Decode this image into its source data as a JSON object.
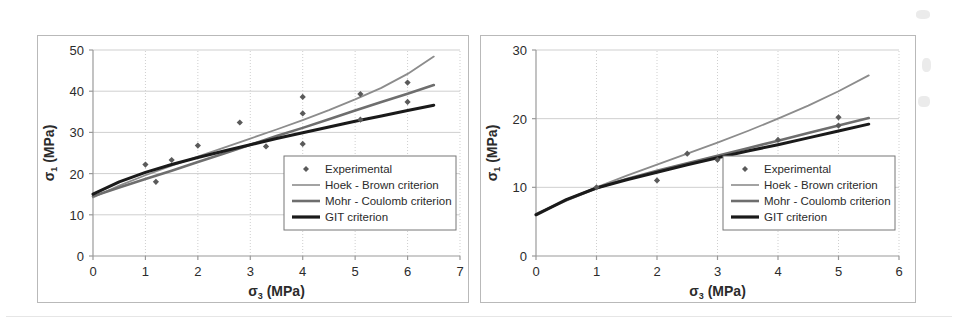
{
  "figure": {
    "background": "#ffffff",
    "panel_border_color": "#b9b9b9"
  },
  "colors": {
    "experimental_marker": "#5a5a5a",
    "hoek_brown": "#8c8c8c",
    "mohr_coulomb": "#6e6e6e",
    "git": "#1a1a1a",
    "gridline": "#cfcfcf",
    "axis": "#9a9a9a",
    "text": "#2b2b2b"
  },
  "legend": {
    "items": [
      {
        "label": "Experimental",
        "style": "marker",
        "color": "#5a5a5a",
        "width": 0
      },
      {
        "label": "Hoek - Brown criterion",
        "style": "line",
        "color": "#8c8c8c",
        "width": 1.6
      },
      {
        "label": "Mohr - Coulomb criterion",
        "style": "line",
        "color": "#6e6e6e",
        "width": 2.6
      },
      {
        "label": "GIT criterion",
        "style": "line",
        "color": "#1a1a1a",
        "width": 3.2
      }
    ]
  },
  "chart_data": [
    {
      "id": "left",
      "type": "line",
      "title": "",
      "xlabel": "σ₃ (MPa)",
      "ylabel": "σ₁ (MPa)",
      "xlabel_base": "σ",
      "xlabel_sub": "3",
      "xlabel_unit": " (MPa)",
      "ylabel_base": "σ",
      "ylabel_sub": "1",
      "ylabel_unit": " (MPa)",
      "xlim": [
        0,
        7
      ],
      "ylim": [
        0,
        50
      ],
      "xticks": [
        0,
        1,
        2,
        3,
        4,
        5,
        6,
        7
      ],
      "yticks": [
        0,
        10,
        20,
        30,
        40,
        50
      ],
      "grid": true,
      "legend_position": "lower-right",
      "scatter": {
        "name": "Experimental",
        "points": [
          [
            1.0,
            22.2
          ],
          [
            1.2,
            18.0
          ],
          [
            1.5,
            23.3
          ],
          [
            2.0,
            26.8
          ],
          [
            2.8,
            32.4
          ],
          [
            3.3,
            26.6
          ],
          [
            4.0,
            38.6
          ],
          [
            4.0,
            34.6
          ],
          [
            4.0,
            27.2
          ],
          [
            5.1,
            39.3
          ],
          [
            5.1,
            33.1
          ],
          [
            6.0,
            42.1
          ],
          [
            6.0,
            37.4
          ]
        ]
      },
      "series": [
        {
          "name": "Hoek - Brown criterion",
          "color": "#8c8c8c",
          "width": 1.8,
          "x": [
            0.0,
            0.5,
            1.0,
            1.5,
            2.0,
            2.5,
            3.0,
            3.5,
            4.0,
            4.5,
            5.0,
            5.5,
            6.0,
            6.5
          ],
          "y": [
            14.2,
            17.1,
            19.6,
            21.9,
            24.1,
            26.3,
            28.5,
            30.7,
            33.0,
            35.4,
            38.0,
            40.8,
            44.2,
            48.4
          ]
        },
        {
          "name": "Mohr - Coulomb criterion",
          "color": "#6e6e6e",
          "width": 2.6,
          "x": [
            0.0,
            0.5,
            1.0,
            1.5,
            2.0,
            2.5,
            3.0,
            3.5,
            4.0,
            4.5,
            5.0,
            5.5,
            6.0,
            6.5
          ],
          "y": [
            14.5,
            16.6,
            18.7,
            20.7,
            22.8,
            24.9,
            27.0,
            29.1,
            31.1,
            33.2,
            35.3,
            37.4,
            39.4,
            41.5
          ]
        },
        {
          "name": "GIT criterion",
          "color": "#1a1a1a",
          "width": 3.0,
          "x": [
            0.0,
            0.5,
            1.0,
            1.5,
            2.0,
            2.5,
            3.0,
            3.5,
            4.0,
            4.5,
            5.0,
            5.5,
            6.0,
            6.5
          ],
          "y": [
            15.0,
            18.0,
            20.3,
            22.2,
            23.9,
            25.5,
            27.0,
            28.5,
            29.9,
            31.3,
            32.7,
            34.0,
            35.3,
            36.6
          ]
        }
      ]
    },
    {
      "id": "right",
      "type": "line",
      "title": "",
      "xlabel": "σ₃ (MPa)",
      "ylabel": "σ₁ (MPa)",
      "xlabel_base": "σ",
      "xlabel_sub": "3",
      "xlabel_unit": " (MPa)",
      "ylabel_base": "σ",
      "ylabel_sub": "1",
      "ylabel_unit": " (MPa)",
      "xlim": [
        0,
        6
      ],
      "ylim": [
        0,
        30
      ],
      "xticks": [
        0,
        1,
        2,
        3,
        4,
        5,
        6
      ],
      "yticks": [
        0,
        10,
        20,
        30
      ],
      "grid": true,
      "legend_position": "lower-right",
      "scatter": {
        "name": "Experimental",
        "points": [
          [
            1.0,
            10.0
          ],
          [
            2.0,
            11.0
          ],
          [
            2.5,
            14.9
          ],
          [
            3.0,
            14.0
          ],
          [
            4.0,
            16.9
          ],
          [
            5.0,
            20.2
          ],
          [
            5.0,
            19.0
          ]
        ]
      },
      "series": [
        {
          "name": "Hoek - Brown criterion",
          "color": "#8c8c8c",
          "width": 1.8,
          "x": [
            0.0,
            0.5,
            1.0,
            1.5,
            2.0,
            2.5,
            3.0,
            3.5,
            4.0,
            4.5,
            5.0,
            5.5
          ],
          "y": [
            6.0,
            8.2,
            10.0,
            11.7,
            13.3,
            14.9,
            16.5,
            18.2,
            20.0,
            21.9,
            24.0,
            26.3
          ]
        },
        {
          "name": "Mohr - Coulomb criterion",
          "color": "#6e6e6e",
          "width": 2.6,
          "x": [
            0.0,
            0.5,
            1.0,
            1.5,
            2.0,
            2.5,
            3.0,
            3.5,
            4.0,
            4.5,
            5.0,
            5.5
          ],
          "y": [
            6.1,
            8.1,
            9.9,
            11.2,
            12.4,
            13.5,
            14.6,
            15.7,
            16.8,
            17.9,
            19.0,
            20.1
          ]
        },
        {
          "name": "GIT criterion",
          "color": "#1a1a1a",
          "width": 3.0,
          "x": [
            0.0,
            0.5,
            1.0,
            1.5,
            2.0,
            2.5,
            3.0,
            3.5,
            4.0,
            4.5,
            5.0,
            5.5
          ],
          "y": [
            6.0,
            8.2,
            9.9,
            11.1,
            12.2,
            13.3,
            14.3,
            15.3,
            16.2,
            17.2,
            18.2,
            19.2
          ]
        }
      ]
    }
  ]
}
